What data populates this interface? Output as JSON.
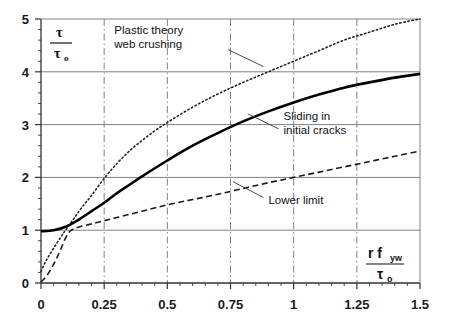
{
  "chart_data": {
    "type": "line",
    "title": "",
    "xlabel": "r f_yw / τ_o",
    "ylabel": "τ / τ_o",
    "xlabel_parts": {
      "num_main": "r f",
      "num_sub": "yw",
      "den_main": "τ",
      "den_sub": "o"
    },
    "ylabel_parts": {
      "num_main": "τ",
      "den_main": "τ",
      "den_sub": "o"
    },
    "xlim": [
      0,
      1.5
    ],
    "ylim": [
      0,
      5
    ],
    "xticks": [
      0,
      0.25,
      0.5,
      0.75,
      1,
      1.25,
      1.5
    ],
    "xticklabels": [
      "0",
      "0.25",
      "0.5",
      "0.75",
      "1",
      "1.25",
      "1.5"
    ],
    "yticks": [
      0,
      1,
      2,
      3,
      4,
      5
    ],
    "yticklabels": [
      "0",
      "1",
      "2",
      "3",
      "4",
      "5"
    ],
    "y_minor_step": 0.2,
    "x_minor_step": 0.05,
    "grid": {
      "horizontal": "solid",
      "vertical": "dash-dot",
      "color": "#808080"
    },
    "legend_position": "inline-annotations",
    "series": [
      {
        "name": "Plastic theory web crushing",
        "style": "dotted",
        "width": 1.6,
        "color": "#222222",
        "x": [
          0,
          0.02,
          0.05,
          0.08,
          0.1,
          0.13,
          0.16,
          0.2,
          0.25,
          0.3,
          0.35,
          0.4,
          0.45,
          0.5,
          0.6,
          0.7,
          0.8,
          0.9,
          1.0,
          1.1,
          1.2,
          1.3,
          1.4,
          1.5
        ],
        "y": [
          0.22,
          0.42,
          0.66,
          0.88,
          1.02,
          1.22,
          1.42,
          1.66,
          1.98,
          2.26,
          2.5,
          2.7,
          2.88,
          3.04,
          3.33,
          3.58,
          3.8,
          4.0,
          4.2,
          4.4,
          4.6,
          4.75,
          4.9,
          5.0
        ]
      },
      {
        "name": "Sliding in initial cracks",
        "style": "solid",
        "width": 2.6,
        "color": "#000000",
        "x": [
          0,
          0.05,
          0.1,
          0.15,
          0.2,
          0.25,
          0.3,
          0.35,
          0.4,
          0.5,
          0.6,
          0.7,
          0.8,
          0.9,
          1.0,
          1.1,
          1.2,
          1.3,
          1.4,
          1.5
        ],
        "y": [
          0.98,
          1.0,
          1.07,
          1.2,
          1.36,
          1.52,
          1.7,
          1.86,
          2.02,
          2.32,
          2.6,
          2.84,
          3.06,
          3.25,
          3.42,
          3.57,
          3.7,
          3.8,
          3.89,
          3.96
        ]
      },
      {
        "name": "Lower limit",
        "style": "dashed",
        "width": 1.6,
        "color": "#1a1a1a",
        "x": [
          0,
          0.02,
          0.04,
          0.06,
          0.08,
          0.1,
          0.12,
          0.15,
          0.2,
          0.25,
          0.3,
          0.4,
          0.5,
          0.6,
          0.7,
          0.8,
          0.9,
          1.0,
          1.1,
          1.2,
          1.3,
          1.4,
          1.5
        ],
        "y": [
          0.02,
          0.12,
          0.27,
          0.45,
          0.66,
          0.88,
          1.0,
          1.06,
          1.12,
          1.18,
          1.24,
          1.36,
          1.48,
          1.58,
          1.68,
          1.79,
          1.9,
          2.0,
          2.1,
          2.2,
          2.3,
          2.4,
          2.5
        ]
      }
    ],
    "annotations": [
      {
        "id": "plastic-theory",
        "lines": [
          "Plastic theory",
          "web crushing"
        ],
        "text_x": 0.29,
        "text_y": 4.72,
        "leader": [
          [
            0.74,
            4.42
          ],
          [
            0.88,
            4.1
          ]
        ]
      },
      {
        "id": "sliding-cracks",
        "lines": [
          "Sliding in",
          "initial cracks"
        ],
        "text_x": 0.96,
        "text_y": 3.08,
        "leader": [
          [
            0.94,
            2.92
          ],
          [
            0.82,
            3.2
          ]
        ]
      },
      {
        "id": "lower-limit",
        "lines": [
          "Lower limit"
        ],
        "text_x": 0.9,
        "text_y": 1.5,
        "leader": [
          [
            0.88,
            1.62
          ],
          [
            0.76,
            1.92
          ]
        ]
      }
    ]
  }
}
